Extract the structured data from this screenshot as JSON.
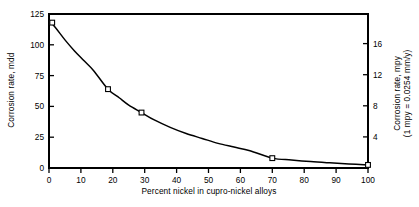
{
  "chart_data": {
    "type": "line",
    "title": "",
    "subtitle": "",
    "xlabel": "Percent nickel in cupro-nickel alloys",
    "ylabel": "Corrosion rate, mdd",
    "y2label_line1": "Corrosion rate, mpy",
    "y2label_line2": "(1 mpy = 0.0254 mm/y)",
    "xlim": [
      0,
      100
    ],
    "ylim": [
      0,
      125
    ],
    "y2lim": [
      0,
      19.8
    ],
    "xticks": [
      0,
      10,
      20,
      30,
      40,
      50,
      60,
      70,
      80,
      90,
      100
    ],
    "xticklabels": [
      "0",
      "10",
      "20",
      "30",
      "40",
      "50",
      "60",
      "70",
      "80",
      "90",
      "100"
    ],
    "yticks": [
      0,
      25,
      50,
      75,
      100,
      125
    ],
    "yticklabels": [
      "0",
      "25",
      "50",
      "75",
      "100",
      "125"
    ],
    "y2ticks": [
      4,
      8,
      12,
      16
    ],
    "y2ticklabels": [
      "4",
      "8",
      "12",
      "16"
    ],
    "grid": false,
    "legend": false,
    "series": [
      {
        "name": "Corrosion rate vs percent nickel",
        "marker": "open-square",
        "line_color": "#000000",
        "x": [
          1,
          18.5,
          29,
          70,
          100
        ],
        "y": [
          118,
          64,
          45,
          8,
          2.5
        ]
      }
    ],
    "curve": {
      "description": "smooth exponential-decay curve through the data points",
      "x": [
        0,
        2,
        5,
        8,
        11,
        14,
        18.5,
        22,
        25,
        29,
        33,
        38,
        43,
        48,
        53,
        58,
        63,
        70,
        76,
        82,
        88,
        94,
        100
      ],
      "y": [
        120,
        114,
        104,
        95,
        87,
        79,
        64,
        57,
        51,
        45,
        39,
        33,
        28,
        24,
        20,
        17,
        14,
        8,
        6.5,
        5.2,
        4.2,
        3.3,
        2.5
      ]
    },
    "colors": {
      "axis": "#000000",
      "line": "#000000",
      "marker_face": "#ffffff",
      "marker_edge": "#000000",
      "background": "#ffffff"
    }
  }
}
